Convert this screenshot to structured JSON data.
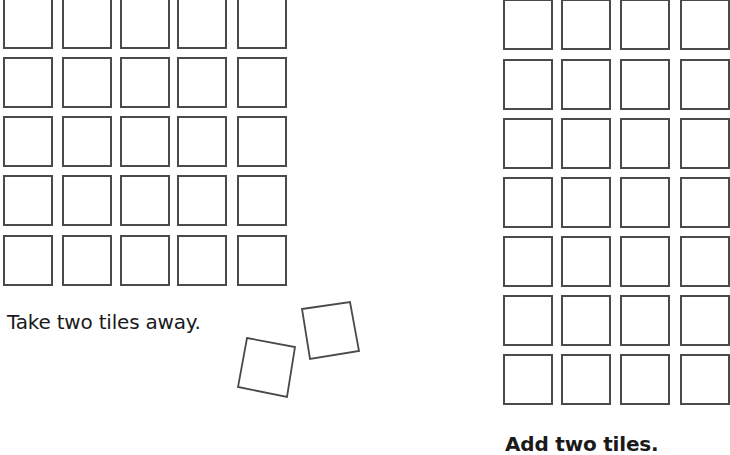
{
  "left_panel": {
    "caption": "Take two tiles away.",
    "grid": {
      "rows": 5,
      "cols": 5,
      "col_x": [
        3,
        62,
        120,
        177,
        237
      ],
      "row_y": [
        -2,
        57,
        116,
        175,
        235
      ],
      "tile_w": 50,
      "tile_h": 51
    },
    "loose_tiles": [
      {
        "points": "302,309 350,302 359,351 310,359"
      },
      {
        "points": "247,338 295,347 287,397 238,387"
      }
    ]
  },
  "right_panel": {
    "caption": "Add two tiles.",
    "grid": {
      "rows": 7,
      "cols": 4,
      "col_x": [
        503,
        561,
        620,
        680
      ],
      "row_y": [
        -1,
        59,
        118,
        177,
        236,
        295,
        354
      ],
      "tile_w": 50,
      "tile_h": 51
    }
  },
  "colors": {
    "tile_border": "#4a4a4a",
    "text": "#1a1a1a",
    "background": "#ffffff"
  }
}
